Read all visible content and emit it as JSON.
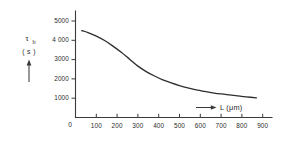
{
  "figure": {
    "background_color": "#ffffff",
    "ink_color": "#2e2e2e",
    "origin_label": "0"
  },
  "chart_data": {
    "type": "line",
    "title": "",
    "subtitle": "",
    "xlabel": "L (μm)",
    "ylabel": "τb ( s )",
    "ylabel_symbol": "τ",
    "ylabel_subscript": "b",
    "ylabel_units": "( s )",
    "xlim": [
      0,
      950
    ],
    "ylim": [
      0,
      5400
    ],
    "grid": false,
    "legend": null,
    "x_ticks": [
      0,
      100,
      200,
      300,
      400,
      500,
      600,
      700,
      800,
      900
    ],
    "x_tick_labels": [
      "0",
      "100",
      "200",
      "300",
      "400",
      "500",
      "600",
      "700",
      "800",
      "900"
    ],
    "y_ticks": [
      1000,
      2000,
      3000,
      4000,
      5000
    ],
    "y_tick_labels": [
      "1000",
      "2000",
      "3000",
      "4 000",
      "5000"
    ],
    "series": [
      {
        "name": "tau_b",
        "x": [
          30,
          60,
          100,
          140,
          180,
          220,
          260,
          300,
          340,
          380,
          420,
          460,
          500,
          540,
          580,
          620,
          660,
          700,
          740,
          780,
          820,
          870
        ],
        "values": [
          4500,
          4400,
          4220,
          3990,
          3700,
          3380,
          3020,
          2660,
          2380,
          2150,
          1950,
          1790,
          1650,
          1530,
          1430,
          1350,
          1280,
          1220,
          1170,
          1120,
          1070,
          1020
        ]
      }
    ],
    "annotations": [
      {
        "name": "y-axis-arrow",
        "text": "",
        "direction": "up"
      },
      {
        "name": "x-axis-arrow",
        "text": "",
        "direction": "right"
      }
    ]
  }
}
